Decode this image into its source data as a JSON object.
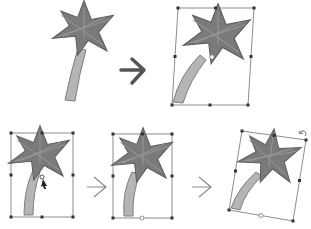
{
  "diagram": {
    "type": "transform-steps-illustration",
    "colors": {
      "background": "#ffffff",
      "foliage": "#7a7a7a",
      "foliage_dark": "#5e5e5e",
      "trunk": "#b5b5b5",
      "trunk_outline": "#7d7d7d",
      "frame": "#6f6f6f",
      "handle": "#333333",
      "arrow_big": "#555555",
      "arrow_small": "#8a8a8a"
    },
    "top_row": [
      {
        "id": "original",
        "description": "palm tree, unselected"
      },
      {
        "id": "skewed",
        "description": "palm tree with transform frame, skewed/bent"
      }
    ],
    "bottom_row": [
      {
        "id": "step-1-select",
        "description": "palm tree selected, cursor on skew handle"
      },
      {
        "id": "step-2-skew",
        "description": "palm tree skewed within frame"
      },
      {
        "id": "step-3-rotate",
        "description": "palm tree frame rotated with rotate handle"
      }
    ],
    "arrows": [
      {
        "id": "arrow-top",
        "style": "bold"
      },
      {
        "id": "arrow-bottom-1",
        "style": "thin"
      },
      {
        "id": "arrow-bottom-2",
        "style": "thin"
      }
    ]
  }
}
